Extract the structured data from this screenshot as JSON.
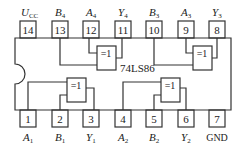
{
  "chip": {
    "part_number": "74LS86",
    "body": {
      "x": 15,
      "y": 38,
      "width": 216,
      "height": 72,
      "notch": "left"
    },
    "top_pins": [
      {
        "number": "14",
        "label": "U",
        "sub": "CC",
        "x": 20
      },
      {
        "number": "13",
        "label": "B",
        "sub": "4",
        "x": 52
      },
      {
        "number": "12",
        "label": "A",
        "sub": "4",
        "x": 83
      },
      {
        "number": "11",
        "label": "Y",
        "sub": "4",
        "x": 115
      },
      {
        "number": "10",
        "label": "B",
        "sub": "3",
        "x": 146
      },
      {
        "number": "9",
        "label": "A",
        "sub": "3",
        "x": 178
      },
      {
        "number": "8",
        "label": "Y",
        "sub": "3",
        "x": 209
      }
    ],
    "bottom_pins": [
      {
        "number": "1",
        "label": "A",
        "sub": "1",
        "x": 20
      },
      {
        "number": "2",
        "label": "B",
        "sub": "1",
        "x": 52
      },
      {
        "number": "3",
        "label": "Y",
        "sub": "1",
        "x": 83
      },
      {
        "number": "4",
        "label": "A",
        "sub": "2",
        "x": 115
      },
      {
        "number": "5",
        "label": "B",
        "sub": "2",
        "x": 146
      },
      {
        "number": "6",
        "label": "Y",
        "sub": "2",
        "x": 178
      },
      {
        "number": "7",
        "label": "GND",
        "sub": "",
        "x": 209
      }
    ],
    "gate_symbol": "=1",
    "gates": [
      {
        "name": "gate-4",
        "position": "upper-left"
      },
      {
        "name": "gate-3",
        "position": "upper-right"
      },
      {
        "name": "gate-1",
        "position": "lower-left"
      },
      {
        "name": "gate-2",
        "position": "lower-right"
      }
    ]
  }
}
